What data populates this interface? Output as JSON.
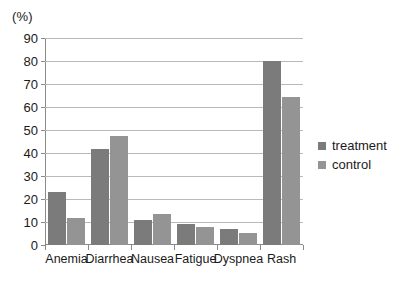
{
  "chart_data": {
    "type": "bar",
    "title": "",
    "subtitle": "",
    "xlabel": "",
    "ylabel": "(%)",
    "yunit": "(%)",
    "ylim": [
      0,
      90
    ],
    "ytick_step": 10,
    "yticks": [
      90,
      80,
      70,
      60,
      50,
      40,
      30,
      20,
      10,
      0
    ],
    "grid": true,
    "grid_axis": "y",
    "legend_position": "right",
    "categories": [
      "Anemia",
      "Diarrhea",
      "Nausea",
      "Fatigue",
      "Dyspnea",
      "Rash"
    ],
    "series": [
      {
        "name": "treatment",
        "color": "#7b7b7b",
        "values": [
          23.2,
          41.9,
          11.0,
          9.0,
          6.8,
          80.0
        ]
      },
      {
        "name": "control",
        "color": "#949494",
        "values": [
          11.7,
          47.6,
          13.5,
          8.0,
          5.4,
          64.5
        ]
      }
    ]
  },
  "legend": {
    "items": [
      {
        "label": "treatment",
        "color": "#7b7b7b"
      },
      {
        "label": "control",
        "color": "#949494"
      }
    ]
  },
  "axes": {
    "y_unit_label": "(%)",
    "y_tick_labels": [
      "90",
      "80",
      "70",
      "60",
      "50",
      "40",
      "30",
      "20",
      "10",
      "0"
    ],
    "x_tick_labels": [
      "Anemia",
      "Diarrhea",
      "Nausea",
      "Fatigue",
      "Dyspnea",
      "Rash"
    ]
  },
  "colors": {
    "treatment": "#7b7b7b",
    "control": "#949494",
    "gridline": "#b9b9b9",
    "axis": "#8a8a8a",
    "text": "#1a1a1a",
    "background": "#ffffff"
  }
}
